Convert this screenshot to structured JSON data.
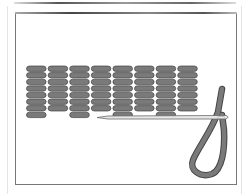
{
  "diagram": {
    "elements": [
      "stitch-block",
      "needle",
      "thread-loop"
    ],
    "stitch_block": {
      "columns": 8,
      "rows_per_column": [
        8,
        7,
        8,
        7,
        8,
        7,
        8,
        7
      ],
      "fill_color": "#7a7a7a",
      "outline_color": "#444444",
      "gap_color": "#ffffff"
    },
    "needle": {
      "color": "#e6e6e6",
      "outline": "#666666"
    },
    "thread": {
      "color": "#7a7a7a",
      "outline": "#444444"
    }
  }
}
